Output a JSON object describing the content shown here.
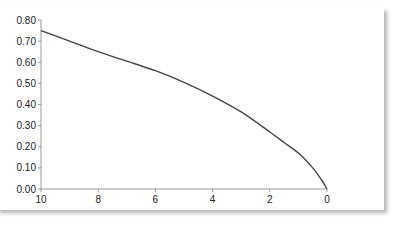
{
  "chart_data": {
    "type": "line",
    "title": "",
    "xlabel": "",
    "ylabel": "",
    "xlim": [
      10,
      0
    ],
    "ylim": [
      0,
      0.8
    ],
    "x_reversed": true,
    "grid": false,
    "legend": "none",
    "x_ticks": [
      "10",
      "8",
      "6",
      "4",
      "2",
      "0"
    ],
    "y_ticks": [
      "0.00",
      "0.10",
      "0.20",
      "0.30",
      "0.40",
      "0.50",
      "0.60",
      "0.70",
      "0.80"
    ],
    "series": [
      {
        "name": "curve",
        "color": "#444444",
        "x": [
          10,
          9,
          8,
          7,
          6,
          5,
          4,
          3,
          2,
          1.5,
          1,
          0.5,
          0.2,
          0
        ],
        "y": [
          0.75,
          0.7,
          0.65,
          0.605,
          0.56,
          0.505,
          0.44,
          0.365,
          0.27,
          0.22,
          0.17,
          0.1,
          0.045,
          0
        ]
      }
    ]
  }
}
